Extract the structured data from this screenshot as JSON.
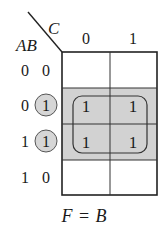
{
  "kmap": {
    "row_variables": "AB",
    "col_variable": "C",
    "col_headers": [
      "0",
      "1"
    ],
    "rows": [
      {
        "label_a": "0",
        "label_b": "0",
        "b_circled": false,
        "cells": [
          "",
          ""
        ],
        "shaded": false
      },
      {
        "label_a": "0",
        "label_b": "1",
        "b_circled": true,
        "cells": [
          "1",
          "1"
        ],
        "shaded": true
      },
      {
        "label_a": "1",
        "label_b": "1",
        "b_circled": true,
        "cells": [
          "1",
          "1"
        ],
        "shaded": true
      },
      {
        "label_a": "1",
        "label_b": "0",
        "b_circled": false,
        "cells": [
          "",
          ""
        ],
        "shaded": false
      }
    ],
    "group": {
      "rows": [
        1,
        2
      ],
      "cols": [
        0,
        1
      ]
    },
    "colors": {
      "line": "#222222",
      "shade": "#d2d2d2",
      "circle_fill": "#d6d6d6",
      "text": "#1a1a1a"
    }
  },
  "result": {
    "lhs": "F",
    "eq": "=",
    "rhs": "B"
  }
}
